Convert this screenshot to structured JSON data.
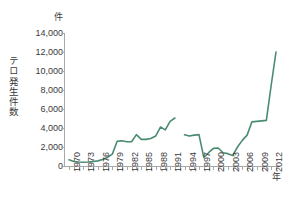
{
  "chart_data": {
    "type": "line",
    "title": "",
    "subtitle": "",
    "xlabel": "年",
    "ylabel": "テロ発生件数",
    "y_unit": "件",
    "ylim": [
      0,
      14000
    ],
    "ytick_labels": [
      "14,000",
      "12,000",
      "10,000",
      "8,000",
      "6,000",
      "4,000",
      "2,000",
      "0"
    ],
    "ytick_values": [
      14000,
      12000,
      10000,
      8000,
      6000,
      4000,
      2000,
      0
    ],
    "xlim": [
      1970,
      2013
    ],
    "xtick_labels": [
      "1970",
      "1973",
      "1976",
      "1979",
      "1982",
      "1985",
      "1988",
      "1991",
      "1994",
      "1997",
      "2000",
      "2003",
      "2006",
      "2009",
      "2012"
    ],
    "xtick_values": [
      1970,
      1973,
      1976,
      1979,
      1982,
      1985,
      1988,
      1991,
      1994,
      1997,
      2000,
      2003,
      2006,
      2009,
      2012
    ],
    "grid": false,
    "legend": "none",
    "line_color": "#4a8c6f",
    "missing_years": [
      1993
    ],
    "x": [
      1970,
      1971,
      1972,
      1973,
      1974,
      1975,
      1976,
      1977,
      1978,
      1979,
      1980,
      1981,
      1982,
      1983,
      1984,
      1985,
      1986,
      1987,
      1988,
      1989,
      1990,
      1991,
      1992,
      1994,
      1995,
      1996,
      1997,
      1998,
      1999,
      2000,
      2001,
      2002,
      2003,
      2004,
      2005,
      2006,
      2007,
      2008,
      2009,
      2010,
      2011,
      2012,
      2013
    ],
    "values": [
      650,
      480,
      420,
      400,
      420,
      480,
      540,
      680,
      900,
      1250,
      2600,
      2650,
      2550,
      2550,
      3300,
      2800,
      2800,
      2900,
      3150,
      4100,
      3800,
      4700,
      5050,
      3300,
      3150,
      3250,
      3300,
      900,
      1400,
      1850,
      1900,
      1400,
      1300,
      1100,
      2000,
      2700,
      3250,
      4650,
      4700,
      4750,
      4800,
      8500,
      12000
    ],
    "series": [
      {
        "name": "テロ発生件数",
        "values": [
          650,
          480,
          420,
          400,
          420,
          480,
          540,
          680,
          900,
          1250,
          2600,
          2650,
          2550,
          2550,
          3300,
          2800,
          2800,
          2900,
          3150,
          4100,
          3800,
          4700,
          5050,
          3300,
          3150,
          3250,
          3300,
          900,
          1400,
          1850,
          1900,
          1400,
          1300,
          1100,
          2000,
          2700,
          3250,
          4650,
          4700,
          4750,
          4800,
          8500,
          12000
        ]
      }
    ]
  }
}
